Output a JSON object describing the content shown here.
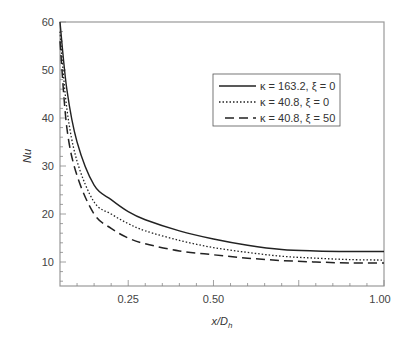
{
  "chart_data": {
    "type": "line",
    "title": "",
    "xlabel": "x/D_h",
    "ylabel": "Nu",
    "xlim": [
      0.05,
      1.0
    ],
    "ylim": [
      5,
      60
    ],
    "grid": false,
    "legend_position": "upper right (inside)",
    "x_ticks": [
      0.25,
      0.5,
      1.0
    ],
    "x_tick_labels": [
      "0.25",
      "0.50",
      "1.00"
    ],
    "y_ticks": [
      10,
      20,
      30,
      40,
      50,
      60
    ],
    "y_tick_labels": [
      "10",
      "20",
      "30",
      "40",
      "50",
      "60"
    ],
    "x": [
      0.05,
      0.07,
      0.1,
      0.15,
      0.2,
      0.25,
      0.3,
      0.4,
      0.5,
      0.6,
      0.7,
      0.8,
      0.9,
      1.0
    ],
    "series": [
      {
        "name": "κ = 163.2, ξ = 0",
        "style": "solid",
        "values": [
          60,
          46,
          35,
          26,
          23,
          20.5,
          18.8,
          16.5,
          14.8,
          13.5,
          12.6,
          12.3,
          12.2,
          12.2
        ]
      },
      {
        "name": "κ = 40.8, ξ = 0",
        "style": "dotted",
        "values": [
          58,
          42,
          31,
          22.5,
          20,
          18,
          16.5,
          14.5,
          13,
          12,
          11.2,
          10.8,
          10.5,
          10.4
        ]
      },
      {
        "name": "κ = 40.8, ξ = 50",
        "style": "dashed",
        "values": [
          56,
          38,
          28,
          20,
          17,
          15,
          13.8,
          12.3,
          11.5,
          10.8,
          10.3,
          10,
          9.8,
          9.8
        ]
      }
    ]
  },
  "labels": {
    "xlabel_main": "x/D",
    "xlabel_sub": "h",
    "ylabel": "Nu"
  }
}
